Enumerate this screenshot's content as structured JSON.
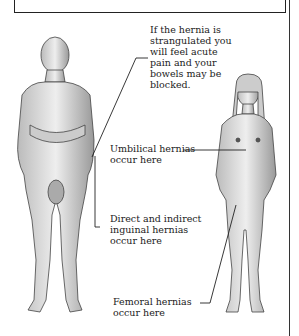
{
  "figure": {
    "labels": [
      {
        "id": "strangulated",
        "lines": [
          "If the hernia is",
          "strangulated you",
          "will feel acute",
          "pain and your",
          "bowels may be",
          "blocked."
        ]
      },
      {
        "id": "umbilical",
        "lines": [
          "Umbilical hernias",
          "occur here"
        ]
      },
      {
        "id": "inguinal",
        "lines": [
          "Direct and indirect",
          "inguinal hernias",
          "occur here"
        ]
      },
      {
        "id": "femoral",
        "lines": [
          "Femoral hernias",
          "occur here"
        ]
      }
    ],
    "figures": [
      "male-figure",
      "female-figure"
    ]
  }
}
